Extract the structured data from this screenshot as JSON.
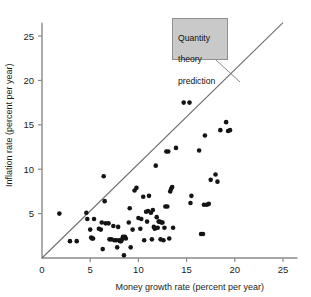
{
  "chart_data": {
    "type": "scatter",
    "title": "",
    "xlabel": "Money growth rate (percent per year)",
    "ylabel": "Inflation rate (percent per year)",
    "xlim": [
      0,
      26.5
    ],
    "ylim": [
      0,
      26.5
    ],
    "xticks": [
      0,
      5,
      10,
      15,
      20,
      25
    ],
    "yticks": [
      0,
      5,
      10,
      15,
      20,
      25
    ],
    "xtick_labels": [
      "0",
      "5",
      "10",
      "15",
      "20",
      "25"
    ],
    "ytick_labels": [
      "0",
      "5",
      "10",
      "15",
      "20",
      "25"
    ],
    "grid": false,
    "legend": null,
    "annotations": [
      {
        "id": "quantity-theory-callout",
        "text": "Quantity\ntheory\nprediction",
        "points_to_line": "reference-line",
        "box_x": 15.2,
        "box_y": 26.0
      }
    ],
    "series": [
      {
        "name": "reference-line",
        "type": "line",
        "label": "Quantity theory prediction",
        "color": "#6e6e6e",
        "x": [
          0,
          25
        ],
        "y": [
          0,
          26.5
        ],
        "note": "45-degree line: inflation equals money growth"
      },
      {
        "name": "countries",
        "type": "scatter",
        "color": "#141414",
        "marker": "circle",
        "points": [
          [
            1.8,
            5.0
          ],
          [
            2.9,
            1.9
          ],
          [
            3.6,
            1.9
          ],
          [
            4.6,
            5.1
          ],
          [
            4.7,
            4.4
          ],
          [
            5.0,
            3.2
          ],
          [
            5.1,
            2.3
          ],
          [
            5.2,
            2.2
          ],
          [
            5.3,
            2.2
          ],
          [
            5.4,
            4.4
          ],
          [
            5.9,
            3.3
          ],
          [
            6.1,
            3.2
          ],
          [
            6.2,
            4.0
          ],
          [
            6.3,
            1.0
          ],
          [
            6.4,
            9.2
          ],
          [
            6.5,
            6.4
          ],
          [
            6.6,
            3.9
          ],
          [
            6.9,
            3.9
          ],
          [
            7.0,
            2.1
          ],
          [
            7.2,
            2.1
          ],
          [
            7.4,
            3.6
          ],
          [
            7.5,
            2.0
          ],
          [
            7.7,
            2.0
          ],
          [
            7.8,
            1.2
          ],
          [
            7.9,
            3.5
          ],
          [
            8.0,
            2.0
          ],
          [
            8.1,
            1.9
          ],
          [
            8.2,
            1.9
          ],
          [
            8.3,
            2.1
          ],
          [
            8.4,
            2.4
          ],
          [
            8.5,
            0.3
          ],
          [
            8.6,
            2.4
          ],
          [
            8.7,
            2.2
          ],
          [
            9.0,
            4.0
          ],
          [
            9.1,
            5.6
          ],
          [
            9.2,
            1.2
          ],
          [
            9.4,
            3.2
          ],
          [
            9.6,
            7.6
          ],
          [
            9.8,
            7.9
          ],
          [
            10.0,
            4.5
          ],
          [
            10.2,
            3.3
          ],
          [
            10.3,
            4.4
          ],
          [
            10.5,
            6.9
          ],
          [
            10.6,
            2.0
          ],
          [
            10.8,
            5.2
          ],
          [
            10.9,
            4.1
          ],
          [
            11.0,
            5.3
          ],
          [
            11.1,
            7.0
          ],
          [
            11.3,
            5.1
          ],
          [
            11.4,
            2.1
          ],
          [
            11.5,
            5.4
          ],
          [
            11.6,
            3.5
          ],
          [
            11.7,
            3.3
          ],
          [
            11.8,
            10.4
          ],
          [
            11.9,
            4.6
          ],
          [
            12.0,
            3.4
          ],
          [
            12.1,
            4.1
          ],
          [
            12.2,
            4.1
          ],
          [
            12.3,
            2.1
          ],
          [
            12.4,
            4.0
          ],
          [
            12.5,
            4.0
          ],
          [
            12.6,
            2.0
          ],
          [
            12.7,
            3.4
          ],
          [
            12.8,
            5.8
          ],
          [
            12.9,
            12.0
          ],
          [
            13.0,
            5.8
          ],
          [
            13.1,
            12.0
          ],
          [
            13.2,
            2.2
          ],
          [
            13.3,
            7.5
          ],
          [
            13.4,
            7.8
          ],
          [
            13.5,
            8.0
          ],
          [
            13.6,
            3.4
          ],
          [
            13.9,
            12.4
          ],
          [
            14.7,
            17.5
          ],
          [
            15.3,
            17.5
          ],
          [
            15.4,
            6.2
          ],
          [
            15.5,
            7.0
          ],
          [
            16.3,
            12.1
          ],
          [
            16.5,
            2.7
          ],
          [
            16.7,
            2.7
          ],
          [
            16.8,
            6.0
          ],
          [
            16.9,
            13.8
          ],
          [
            17.1,
            6.0
          ],
          [
            17.3,
            6.1
          ],
          [
            17.5,
            8.8
          ],
          [
            18.0,
            9.4
          ],
          [
            18.2,
            8.6
          ],
          [
            18.5,
            14.4
          ],
          [
            19.1,
            15.3
          ],
          [
            19.3,
            14.3
          ],
          [
            19.5,
            14.4
          ]
        ]
      }
    ]
  },
  "axes": {
    "x_title": "Money growth rate (percent per year)",
    "y_title": "Inflation rate (percent per year)"
  },
  "annotation": {
    "label": "Quantity theory prediction",
    "line1": "Quantity",
    "line2": "theory",
    "line3": "prediction"
  },
  "colors": {
    "point": "#141414",
    "line": "#6e6e6e",
    "axis": "#8a8a8a",
    "annotation_bg": "#c9c9c9",
    "annotation_border": "#8f8f8f",
    "background": "#ffffff"
  }
}
